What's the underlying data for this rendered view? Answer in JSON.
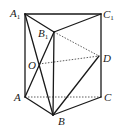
{
  "diagram": {
    "type": "triangular-prism",
    "points": {
      "A1": {
        "label": "A",
        "sub": "1",
        "x": 25,
        "y": 14
      },
      "C1": {
        "label": "C",
        "sub": "1",
        "x": 101,
        "y": 14
      },
      "B1": {
        "label": "B",
        "sub": "1",
        "x": 54,
        "y": 32
      },
      "D": {
        "label": "D",
        "sub": "",
        "x": 99,
        "y": 56
      },
      "O": {
        "label": "O",
        "sub": "",
        "x": 39,
        "y": 64
      },
      "A": {
        "label": "A",
        "sub": "",
        "x": 25,
        "y": 97
      },
      "C": {
        "label": "C",
        "sub": "",
        "x": 101,
        "y": 97
      },
      "B": {
        "label": "B",
        "sub": "",
        "x": 53,
        "y": 115
      }
    },
    "solid_edges": [
      [
        "A1",
        "C1"
      ],
      [
        "A1",
        "B1"
      ],
      [
        "B1",
        "C1"
      ],
      [
        "A1",
        "A"
      ],
      [
        "C1",
        "C"
      ],
      [
        "B1",
        "B"
      ],
      [
        "A",
        "B"
      ],
      [
        "B",
        "C"
      ],
      [
        "A1",
        "B"
      ],
      [
        "A",
        "B1"
      ],
      [
        "B",
        "D"
      ]
    ],
    "dashed_edges": [
      [
        "A",
        "C"
      ],
      [
        "B1",
        "D"
      ],
      [
        "O",
        "D"
      ]
    ],
    "labels": {
      "A1": "A",
      "A1_sub": "1",
      "C1": "C",
      "C1_sub": "1",
      "B1": "B",
      "B1_sub": "1",
      "D": "D",
      "O": "O",
      "A": "A",
      "C": "C",
      "B": "B"
    }
  }
}
